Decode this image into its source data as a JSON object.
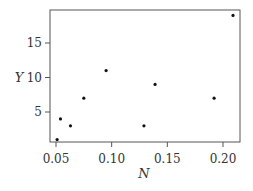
{
  "chart_data": {
    "type": "scatter",
    "title": "",
    "xlabel": "N",
    "ylabel": "Y",
    "xlim": [
      0.046,
      0.212
    ],
    "ylim": [
      0.65,
      19.5
    ],
    "xticks": [
      0.05,
      0.1,
      0.15,
      0.2
    ],
    "xtick_labels": [
      "0.05",
      "0.10",
      "0.15",
      "0.20"
    ],
    "yticks": [
      5,
      10,
      15
    ],
    "ytick_labels": [
      "5",
      "10",
      "15"
    ],
    "grid": false,
    "legend": null,
    "points": [
      {
        "x": 0.051,
        "y": 1
      },
      {
        "x": 0.054,
        "y": 4
      },
      {
        "x": 0.063,
        "y": 3
      },
      {
        "x": 0.075,
        "y": 7
      },
      {
        "x": 0.095,
        "y": 11
      },
      {
        "x": 0.129,
        "y": 3
      },
      {
        "x": 0.139,
        "y": 9
      },
      {
        "x": 0.192,
        "y": 7
      },
      {
        "x": 0.209,
        "y": 19
      }
    ],
    "colors": {
      "points": "#111111",
      "axis": "#555555",
      "text": "#333333"
    }
  }
}
